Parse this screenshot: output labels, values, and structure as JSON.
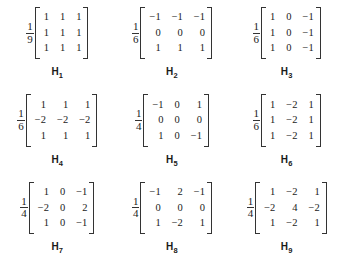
{
  "figure": {
    "type": "matrix-grid",
    "rows": 3,
    "columns": 3,
    "background_color": "#ffffff",
    "text_color": "#1a1a1a"
  },
  "matrices": [
    {
      "label_base": "H",
      "label_sub": "1",
      "label": "H1",
      "scale_numerator": "1",
      "scale_denominator": "9",
      "values": [
        [
          "1",
          "1",
          "1"
        ],
        [
          "1",
          "1",
          "1"
        ],
        [
          "1",
          "1",
          "1"
        ]
      ]
    },
    {
      "label_base": "H",
      "label_sub": "2",
      "label": "H2",
      "scale_numerator": "1",
      "scale_denominator": "6",
      "values": [
        [
          "−1",
          "−1",
          "−1"
        ],
        [
          "0",
          "0",
          "0"
        ],
        [
          "1",
          "1",
          "1"
        ]
      ]
    },
    {
      "label_base": "H",
      "label_sub": "3",
      "label": "H3",
      "scale_numerator": "1",
      "scale_denominator": "6",
      "values": [
        [
          "1",
          "0",
          "−1"
        ],
        [
          "1",
          "0",
          "−1"
        ],
        [
          "1",
          "0",
          "−1"
        ]
      ]
    },
    {
      "label_base": "H",
      "label_sub": "4",
      "label": "H4",
      "scale_numerator": "1",
      "scale_denominator": "6",
      "values": [
        [
          "1",
          "1",
          "1"
        ],
        [
          "−2",
          "−2",
          "−2"
        ],
        [
          "1",
          "1",
          "1"
        ]
      ]
    },
    {
      "label_base": "H",
      "label_sub": "5",
      "label": "H5",
      "scale_numerator": "1",
      "scale_denominator": "4",
      "values": [
        [
          "−1",
          "0",
          "1"
        ],
        [
          "0",
          "0",
          "0"
        ],
        [
          "1",
          "0",
          "−1"
        ]
      ]
    },
    {
      "label_base": "H",
      "label_sub": "6",
      "label": "H6",
      "scale_numerator": "1",
      "scale_denominator": "6",
      "values": [
        [
          "1",
          "−2",
          "1"
        ],
        [
          "1",
          "−2",
          "1"
        ],
        [
          "1",
          "−2",
          "1"
        ]
      ]
    },
    {
      "label_base": "H",
      "label_sub": "7",
      "label": "H7",
      "scale_numerator": "1",
      "scale_denominator": "4",
      "values": [
        [
          "1",
          "0",
          "−1"
        ],
        [
          "−2",
          "0",
          "2"
        ],
        [
          "1",
          "0",
          "−1"
        ]
      ]
    },
    {
      "label_base": "H",
      "label_sub": "8",
      "label": "H8",
      "scale_numerator": "1",
      "scale_denominator": "4",
      "values": [
        [
          "−1",
          "2",
          "−1"
        ],
        [
          "0",
          "0",
          "0"
        ],
        [
          "1",
          "−2",
          "1"
        ]
      ]
    },
    {
      "label_base": "H",
      "label_sub": "9",
      "label": "H9",
      "scale_numerator": "1",
      "scale_denominator": "4",
      "values": [
        [
          "1",
          "−2",
          "1"
        ],
        [
          "−2",
          "4",
          "−2"
        ],
        [
          "1",
          "−2",
          "1"
        ]
      ]
    }
  ]
}
